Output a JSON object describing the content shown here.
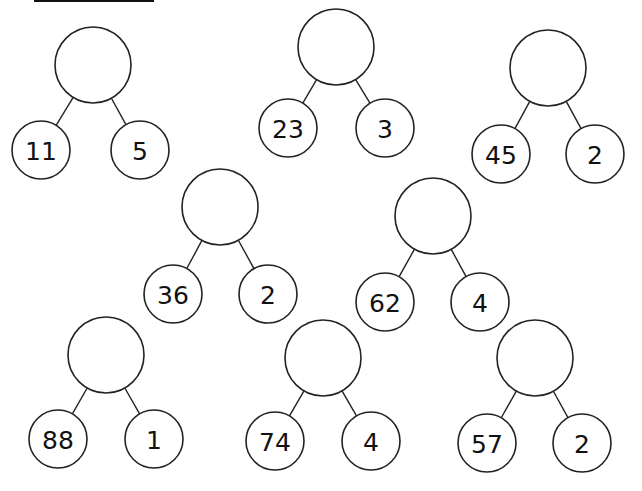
{
  "worksheet": {
    "type": "number bond addition worksheet",
    "header_fragment": "underlined title (cropped)",
    "colors": {
      "line": "#222222",
      "text": "#111111",
      "background": "#ffffff"
    },
    "bonds": [
      {
        "id": 1,
        "whole": "",
        "parts": [
          "11",
          "5"
        ],
        "top": [
          93,
          65
        ],
        "left": [
          41,
          150
        ],
        "right": [
          140,
          150
        ]
      },
      {
        "id": 2,
        "whole": "",
        "parts": [
          "23",
          "3"
        ],
        "top": [
          336,
          47
        ],
        "left": [
          288,
          128
        ],
        "right": [
          385,
          128
        ]
      },
      {
        "id": 3,
        "whole": "",
        "parts": [
          "45",
          "2"
        ],
        "top": [
          548,
          68
        ],
        "left": [
          501,
          154
        ],
        "right": [
          595,
          154
        ]
      },
      {
        "id": 4,
        "whole": "",
        "parts": [
          "36",
          "2"
        ],
        "top": [
          220,
          207
        ],
        "left": [
          173,
          294
        ],
        "right": [
          268,
          294
        ]
      },
      {
        "id": 5,
        "whole": "",
        "parts": [
          "62",
          "4"
        ],
        "top": [
          433,
          216
        ],
        "left": [
          385,
          302
        ],
        "right": [
          480,
          302
        ]
      },
      {
        "id": 6,
        "whole": "",
        "parts": [
          "88",
          "1"
        ],
        "top": [
          106,
          355
        ],
        "left": [
          58,
          439
        ],
        "right": [
          154,
          439
        ]
      },
      {
        "id": 7,
        "whole": "",
        "parts": [
          "74",
          "4"
        ],
        "top": [
          323,
          358
        ],
        "left": [
          275,
          441
        ],
        "right": [
          371,
          441
        ]
      },
      {
        "id": 8,
        "whole": "",
        "parts": [
          "57",
          "2"
        ],
        "top": [
          535,
          358
        ],
        "left": [
          487,
          443
        ],
        "right": [
          582,
          443
        ]
      }
    ],
    "radii": {
      "whole": 38,
      "part": 29
    }
  }
}
